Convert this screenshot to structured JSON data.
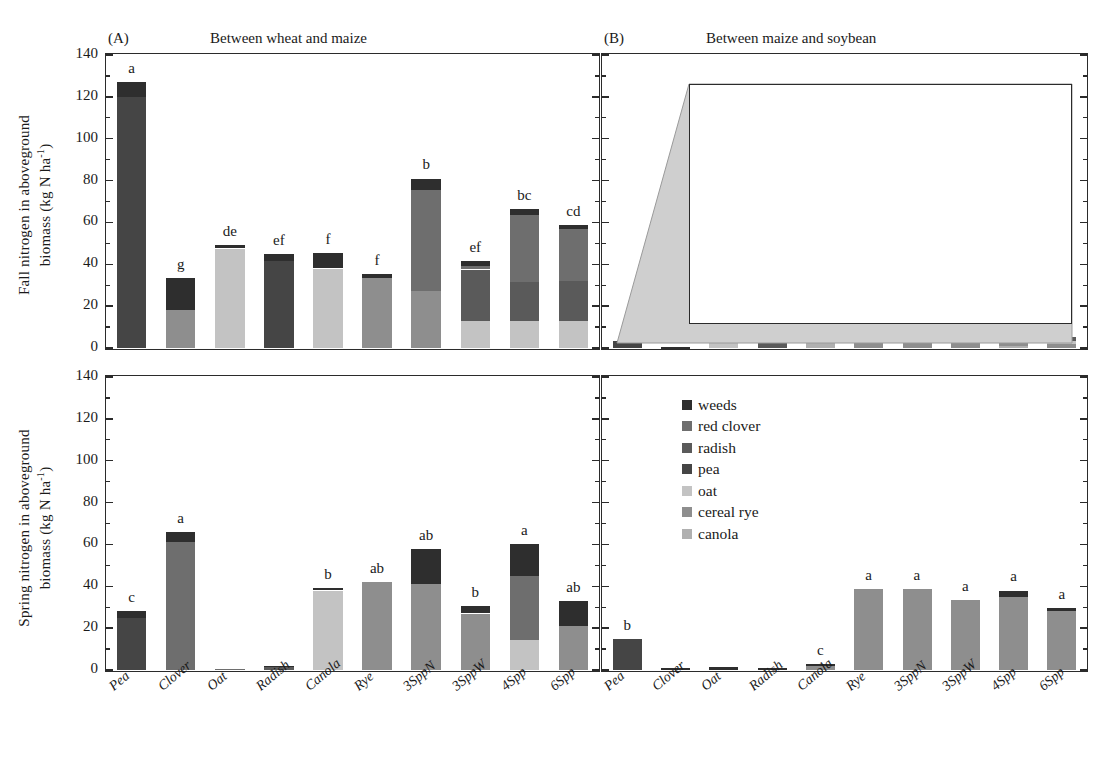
{
  "figure": {
    "y_axis_top_label_lines": [
      "Fall nitrogen in aboveground",
      "biomass (kg N ha-1)"
    ],
    "y_axis_bottom_label_lines": [
      "Spring nitrogen in aboveground",
      "biomass (kg N ha-1)"
    ],
    "panel_a_letter": "(A)",
    "panel_b_letter": "(B)",
    "panel_c_letter": "(C)",
    "panel_d_letter": "(D)",
    "title_left": "Between wheat and maize",
    "title_right": "Between maize and soybean"
  },
  "legend": {
    "position": "panel-d-top-left",
    "items": [
      {
        "label": "weeds",
        "color": "#2e2e2e"
      },
      {
        "label": "red clover",
        "color": "#6e6e6e"
      },
      {
        "label": "radish",
        "color": "#5a5a5a"
      },
      {
        "label": "pea",
        "color": "#454545"
      },
      {
        "label": "oat",
        "color": "#c3c3c3"
      },
      {
        "label": "cereal rye",
        "color": "#8e8e8e"
      },
      {
        "label": "canola",
        "color": "#b0b0b0"
      }
    ]
  },
  "chart_data": [
    {
      "id": "A",
      "type": "bar",
      "stacked": true,
      "title": "Between wheat and maize",
      "panel_letter": "(A)",
      "xlabel": "",
      "ylabel": "Fall nitrogen in aboveground biomass (kg N ha-1)",
      "ylim": [
        0,
        140
      ],
      "yticks": [
        0,
        20,
        40,
        60,
        80,
        100,
        120,
        140
      ],
      "grid": false,
      "categories": [
        "Pea",
        "Clover",
        "Oat",
        "Radish",
        "Canola",
        "Rye",
        "3SppN",
        "3SppW",
        "4Spp",
        "6Spp"
      ],
      "series": [
        {
          "name": "canola",
          "color": "#b0b0b0",
          "values": [
            0,
            0,
            0,
            0,
            0,
            0,
            0,
            0,
            0,
            0
          ]
        },
        {
          "name": "cereal rye",
          "color": "#8e8e8e",
          "values": [
            0,
            18,
            0,
            0,
            0,
            33.5,
            27.5,
            0,
            0,
            0
          ]
        },
        {
          "name": "oat",
          "color": "#c3c3c3",
          "values": [
            0,
            0,
            47.5,
            0,
            38,
            0,
            0,
            13,
            13,
            13
          ]
        },
        {
          "name": "pea",
          "color": "#454545",
          "values": [
            120,
            0,
            0,
            41.5,
            0,
            0,
            0,
            0,
            0,
            0
          ]
        },
        {
          "name": "radish",
          "color": "#5a5a5a",
          "values": [
            0,
            0,
            0,
            0,
            0,
            0,
            0,
            24.5,
            18.5,
            19
          ]
        },
        {
          "name": "red clover",
          "color": "#6e6e6e",
          "values": [
            0,
            0,
            0,
            0,
            0,
            0,
            48,
            1.5,
            32,
            25
          ]
        },
        {
          "name": "weeds",
          "color": "#2e2e2e",
          "values": [
            7,
            15.5,
            1.5,
            3.5,
            7.5,
            2,
            5.5,
            2.5,
            3,
            2
          ]
        }
      ],
      "totals": [
        127,
        33.5,
        49,
        45,
        45.5,
        35.5,
        81,
        41.5,
        66.5,
        59
      ],
      "significance_letters": [
        "a",
        "g",
        "de",
        "ef",
        "f",
        "f",
        "b",
        "ef",
        "bc",
        "cd"
      ]
    },
    {
      "id": "B",
      "type": "bar",
      "stacked": true,
      "title": "Between maize and soybean",
      "panel_letter": "(B)",
      "xlabel": "",
      "ylabel": "Fall nitrogen in aboveground biomass (kg N ha-1)",
      "ylim": [
        0,
        140
      ],
      "yticks": [
        0,
        20,
        40,
        60,
        80,
        100,
        120,
        140
      ],
      "grid": false,
      "note": "Main panel bars are very small; an expanded inset with 0-8 scale is overlaid.",
      "categories": [
        "Pea",
        "Clover",
        "Oat",
        "Radish",
        "Canola",
        "Rye",
        "3SppN",
        "3SppW",
        "4Spp",
        "6Spp"
      ],
      "totals": [
        3.3,
        0.3,
        5.1,
        4.2,
        2.5,
        5.4,
        6.8,
        5.7,
        7.0,
        5.5
      ],
      "significance_letters": [
        "d",
        "f",
        "c",
        "d",
        "e",
        "c",
        "ab",
        "bc",
        "a",
        "c"
      ],
      "inset": {
        "ylim": [
          0,
          8
        ],
        "yticks": [
          0,
          2,
          4,
          6,
          8
        ],
        "categories": [
          "Pea",
          "Clover",
          "Oat",
          "Radish",
          "Canola",
          "Rye",
          "3SppN",
          "3SppW",
          "4Spp",
          "6Spp"
        ],
        "series": [
          {
            "name": "canola",
            "color": "#b0b0b0",
            "values": [
              0,
              0,
              0,
              0,
              2.5,
              0,
              0,
              0,
              1.0,
              0
            ]
          },
          {
            "name": "cereal rye",
            "color": "#8e8e8e",
            "values": [
              0,
              0,
              0,
              0,
              0,
              5.4,
              2.6,
              3.1,
              1.3,
              2.0
            ]
          },
          {
            "name": "oat",
            "color": "#c3c3c3",
            "values": [
              0,
              0,
              5.1,
              0,
              0,
              0,
              2.2,
              2.5,
              1.1,
              1.4
            ]
          },
          {
            "name": "pea",
            "color": "#454545",
            "values": [
              3.3,
              0,
              0,
              0,
              0,
              0,
              0,
              0,
              0,
              0
            ]
          },
          {
            "name": "radish",
            "color": "#5a5a5a",
            "values": [
              0,
              0,
              0,
              4.2,
              0,
              0,
              0,
              0,
              3.5,
              2.1
            ]
          },
          {
            "name": "red clover",
            "color": "#6e6e6e",
            "values": [
              0,
              0,
              0,
              0,
              0,
              0,
              0,
              0,
              0,
              0
            ]
          },
          {
            "name": "weeds",
            "color": "#2e2e2e",
            "values": [
              0,
              0.3,
              0,
              0,
              0,
              0,
              2.0,
              0.1,
              0.1,
              0
            ]
          }
        ],
        "totals": [
          3.3,
          0.3,
          5.1,
          4.2,
          2.5,
          5.4,
          6.8,
          5.7,
          7.0,
          5.5
        ],
        "significance_letters": [
          "d",
          "f",
          "c",
          "d",
          "e",
          "c",
          "ab",
          "bc",
          "a",
          "c"
        ]
      }
    },
    {
      "id": "C",
      "type": "bar",
      "stacked": true,
      "title": "",
      "panel_letter": "(C)",
      "xlabel": "",
      "ylabel": "Spring nitrogen in aboveground biomass (kg N ha-1)",
      "ylim": [
        0,
        140
      ],
      "yticks": [
        0,
        20,
        40,
        60,
        80,
        100,
        120,
        140
      ],
      "grid": false,
      "categories": [
        "Pea",
        "Clover",
        "Oat",
        "Radish",
        "Canola",
        "Rye",
        "3SppN",
        "3SppW",
        "4Spp",
        "6Spp"
      ],
      "series": [
        {
          "name": "canola",
          "color": "#b0b0b0",
          "values": [
            0,
            0,
            0,
            0,
            0,
            0,
            0,
            0,
            0,
            0
          ]
        },
        {
          "name": "cereal rye",
          "color": "#8e8e8e",
          "values": [
            0,
            0,
            0,
            0,
            0,
            42,
            41,
            27,
            0,
            21
          ]
        },
        {
          "name": "oat",
          "color": "#c3c3c3",
          "values": [
            0,
            0,
            0,
            0,
            38,
            0,
            0,
            0,
            14.5,
            0
          ]
        },
        {
          "name": "pea",
          "color": "#454545",
          "values": [
            25,
            0,
            0,
            0,
            0,
            0,
            0,
            0,
            0,
            0
          ]
        },
        {
          "name": "radish",
          "color": "#5a5a5a",
          "values": [
            0,
            0,
            0,
            1.5,
            0,
            0,
            0,
            0,
            0,
            0
          ]
        },
        {
          "name": "red clover",
          "color": "#6e6e6e",
          "values": [
            0,
            61,
            0.3,
            0,
            0,
            0,
            0,
            0,
            30.5,
            0
          ]
        },
        {
          "name": "weeds",
          "color": "#2e2e2e",
          "values": [
            3,
            5,
            0,
            0.5,
            1,
            0,
            17,
            3.5,
            15,
            12
          ]
        }
      ],
      "totals": [
        28,
        66,
        0.3,
        2,
        39,
        42,
        58,
        30.5,
        60,
        33
      ],
      "significance_letters": [
        "c",
        "a",
        "",
        "",
        "b",
        "ab",
        "ab",
        "b",
        "a",
        "ab"
      ]
    },
    {
      "id": "D",
      "type": "bar",
      "stacked": true,
      "title": "",
      "panel_letter": "(D)",
      "xlabel": "",
      "ylabel": "Spring nitrogen in aboveground biomass (kg N ha-1)",
      "ylim": [
        0,
        140
      ],
      "yticks": [
        0,
        20,
        40,
        60,
        80,
        100,
        120,
        140
      ],
      "grid": false,
      "categories": [
        "Pea",
        "Clover",
        "Oat",
        "Radish",
        "Canola",
        "Rye",
        "3SppN",
        "3SppW",
        "4Spp",
        "6Spp"
      ],
      "series": [
        {
          "name": "canola",
          "color": "#b0b0b0",
          "values": [
            0,
            0,
            0,
            0,
            0,
            0,
            0,
            0,
            0,
            0
          ]
        },
        {
          "name": "cereal rye",
          "color": "#8e8e8e",
          "values": [
            0,
            0,
            0,
            0,
            2,
            38.5,
            38.5,
            33.5,
            35,
            28
          ]
        },
        {
          "name": "oat",
          "color": "#c3c3c3",
          "values": [
            0,
            0,
            0,
            0,
            0,
            0,
            0,
            0,
            0,
            0
          ]
        },
        {
          "name": "pea",
          "color": "#454545",
          "values": [
            15,
            0,
            0,
            0,
            0,
            0,
            0,
            0,
            0,
            0
          ]
        },
        {
          "name": "radish",
          "color": "#5a5a5a",
          "values": [
            0,
            0,
            0,
            0,
            0,
            0,
            0,
            0,
            0,
            0
          ]
        },
        {
          "name": "red clover",
          "color": "#6e6e6e",
          "values": [
            0,
            0,
            0,
            0,
            0,
            0,
            0,
            0,
            0,
            0
          ]
        },
        {
          "name": "weeds",
          "color": "#2e2e2e",
          "values": [
            0,
            1.2,
            1.5,
            1,
            0.8,
            0,
            0,
            0,
            3,
            1.8
          ]
        }
      ],
      "totals": [
        15,
        1.2,
        1.5,
        1,
        2.8,
        38.5,
        38.5,
        33.5,
        38,
        29.8
      ],
      "significance_letters": [
        "b",
        "",
        "",
        "",
        "c",
        "a",
        "a",
        "a",
        "a",
        "a"
      ]
    }
  ]
}
